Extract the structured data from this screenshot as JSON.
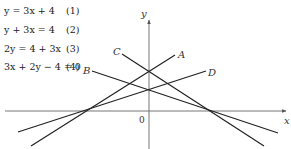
{
  "equations": [
    {
      "expr": "y = 3x + 4",
      "number": "(1)"
    },
    {
      "expr": "y + 3x = 4",
      "number": "(2)"
    },
    {
      "expr": "2y = 4 + 3x",
      "number": "(3)"
    },
    {
      "expr": "3x + 2y − 4 = 0",
      "number": "(4)"
    }
  ],
  "axes": {
    "x_label": "x",
    "y_label": "y",
    "origin_label": "0"
  },
  "lines": [
    {
      "label": "A",
      "equation": "y = 3x + 4"
    },
    {
      "label": "B",
      "equation": "3x + 2y − 4 = 0"
    },
    {
      "label": "C",
      "equation": "y + 3x = 4"
    },
    {
      "label": "D",
      "equation": "2y = 4 + 3x"
    }
  ],
  "colors": {
    "line": "#222222",
    "axis": "#555555",
    "text": "#222222"
  }
}
